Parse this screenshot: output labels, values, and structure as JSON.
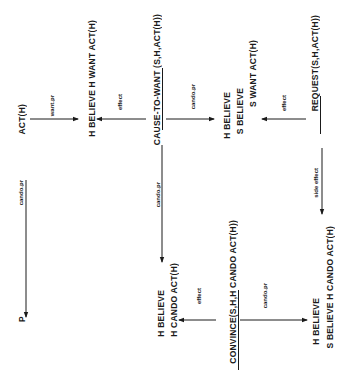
{
  "diagram": {
    "orientation": "rotated-90-ccw",
    "nodes": {
      "act_h": "ACT(H)",
      "h_believe_h_want": "H BELIEVE H WANT  ACT(H)",
      "cause_to_want": "CAUSE-TO-WANT (S,H,ACT(H))",
      "cause_to_want_underlined": "CAUSE-TO-WANT",
      "h_believe_s_believe_s_want": [
        "H BELIEVE",
        "S BELIEVE",
        "S WANT ACT(H)"
      ],
      "request": "REQUEST(S,H,ACT(H))",
      "request_underlined": "REQUEST",
      "p": "P",
      "convince": "CONVINCE(S,H,H CANDO ACT(H))",
      "convince_underlined": "CONVINCE",
      "h_believe_h_cando": [
        "H BELIEVE",
        "H CANDO ACT(H)"
      ],
      "h_believe_s_believe_h_cando": [
        "H BELIEVE",
        "S BELIEVE H CANDO  ACT(H)"
      ]
    },
    "edges": {
      "want_pr": "want.pr",
      "effect_1": "effect",
      "cando_pr_1": "cando.pr",
      "effect_2": "effect",
      "side_effect": "side effect",
      "cando_pr_left": "cando.pr",
      "cando_pr_mid": "cando.pr",
      "effect_3": "effect",
      "cando_pr_bottom": "cando.pr"
    },
    "colors": {
      "ink": "#1a1a1a",
      "background": "#ffffff"
    }
  }
}
